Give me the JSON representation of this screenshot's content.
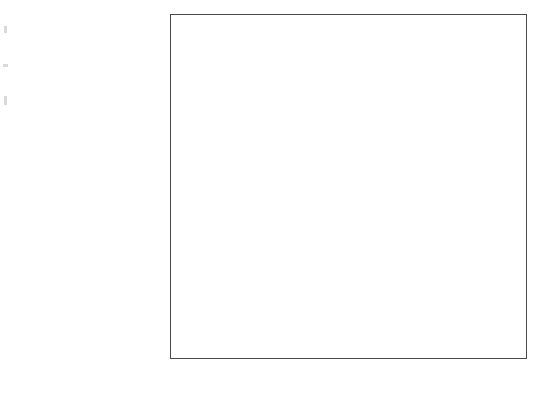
{
  "chart_data": {
    "type": "bar",
    "orientation": "horizontal",
    "title": "",
    "xlabel": "Ratio of smoker deaths to nonsmoker deaths",
    "ylabel": "",
    "categories": [
      "Lung cancer",
      "Bronchitis and emphysema",
      "Cancer of larynx",
      "Oral cancer",
      "Cancer of esophagus",
      "Stomach and duodenal ulcers",
      "Other circulatory diseases",
      "Cirrhosis of liver",
      "Bladder cancer",
      "Other heart diseases",
      "Coronary disease",
      "Arteriosclerosis",
      "Kidney cancer",
      "Hypertension"
    ],
    "values": [
      11.0,
      6.1,
      5.4,
      4.2,
      3.1,
      2.85,
      2.6,
      2.05,
      1.95,
      1.8,
      1.7,
      1.55,
      1.55,
      1.55
    ],
    "xticks": [
      1.5,
      2,
      2.5,
      3,
      3.5,
      4,
      4.5,
      5,
      5.5,
      6,
      10.5,
      11
    ],
    "xtick_labels": [
      "1.5",
      "2",
      "2.5",
      "3",
      "3.5",
      "4",
      "4.5",
      "5",
      "5.5",
      "6",
      "10.5",
      "11"
    ],
    "xlim": [
      1.25,
      11.25
    ],
    "axis_break": {
      "present": true,
      "from": 6.0,
      "to": 10.5,
      "style": "zigzag"
    },
    "grid": "vertical",
    "bar_color": "#696969",
    "axis_color": "#4a4a4a",
    "background": "#ffffff",
    "legend": null
  }
}
